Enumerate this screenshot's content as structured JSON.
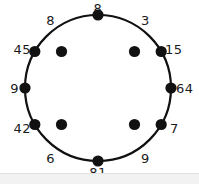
{
  "diagram": {
    "type": "circle-node-diagram",
    "background_color": "#ffffff",
    "stroke_color": "#111111",
    "node_color": "#111111",
    "label_color": "#1a1a1a",
    "circle": {
      "center_x": 98,
      "center_y": 88,
      "radius": 73,
      "stroke_width": 2.2
    },
    "node_radius": 5.6,
    "node_count": 12,
    "nodes": [
      {
        "label": "8",
        "clock": 12,
        "angle_deg": 270,
        "label_anchor": "middle",
        "label_x": 98,
        "label_y": 13,
        "cx": 98,
        "cy": 15
      },
      {
        "label": "3",
        "clock": 1,
        "angle_deg": 300,
        "label_anchor": "start",
        "label_x": 141,
        "label_y": 25,
        "cx": 134.5,
        "cy": 51.5
      },
      {
        "label": "15",
        "clock": 2,
        "angle_deg": 330,
        "label_anchor": "start",
        "label_x": 165,
        "label_y": 54,
        "cx": 161.2,
        "cy": 51.5
      },
      {
        "label": "64",
        "clock": 3,
        "angle_deg": 0,
        "label_anchor": "start",
        "label_x": 176,
        "label_y": 93,
        "cx": 171,
        "cy": 88
      },
      {
        "label": "7",
        "clock": 4,
        "angle_deg": 30,
        "label_anchor": "start",
        "label_x": 170,
        "label_y": 133,
        "cx": 161.2,
        "cy": 124.5
      },
      {
        "label": "9",
        "clock": 5,
        "angle_deg": 60,
        "label_anchor": "start",
        "label_x": 141,
        "label_y": 163,
        "cx": 134.5,
        "cy": 124.5
      },
      {
        "label": "81",
        "clock": 6,
        "angle_deg": 90,
        "label_anchor": "middle",
        "label_x": 98,
        "label_y": 177,
        "cx": 98,
        "cy": 161
      },
      {
        "label": "6",
        "clock": 7,
        "angle_deg": 120,
        "label_anchor": "end",
        "label_x": 55,
        "label_y": 163,
        "cx": 61.5,
        "cy": 124.5
      },
      {
        "label": "42",
        "clock": 8,
        "angle_deg": 150,
        "label_anchor": "end",
        "label_x": 31,
        "label_y": 133,
        "cx": 34.8,
        "cy": 124.5
      },
      {
        "label": "9",
        "clock": 9,
        "angle_deg": 180,
        "label_anchor": "end",
        "label_x": 19,
        "label_y": 93,
        "cx": 25,
        "cy": 88
      },
      {
        "label": "45",
        "clock": 10,
        "angle_deg": 210,
        "label_anchor": "end",
        "label_x": 31,
        "label_y": 54,
        "cx": 34.8,
        "cy": 51.5
      },
      {
        "label": "8",
        "clock": 11,
        "angle_deg": 240,
        "label_anchor": "end",
        "label_x": 55,
        "label_y": 25,
        "cx": 61.5,
        "cy": 51.5
      }
    ],
    "labels_clockwise_from_top": [
      "8",
      "3",
      "15",
      "64",
      "7",
      "9",
      "81",
      "6",
      "42",
      "9",
      "45",
      "8"
    ]
  },
  "footer": {
    "strip_color": "#f2f2f2",
    "border_color": "#e3e3e3"
  }
}
